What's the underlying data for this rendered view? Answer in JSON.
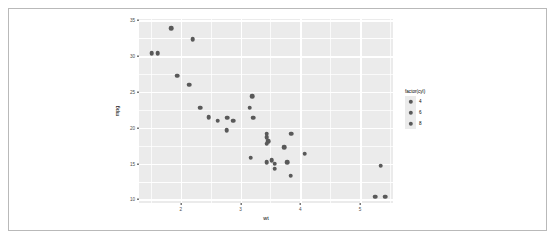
{
  "chart_data": {
    "type": "scatter",
    "title": "",
    "xlabel": "wt",
    "ylabel": "mpg",
    "xlim": [
      1.3,
      5.55
    ],
    "ylim": [
      9.5,
      35.2
    ],
    "xticks": [
      "2",
      "3",
      "4",
      "5"
    ],
    "xtick_values": [
      2,
      3,
      4,
      5
    ],
    "yticks": [
      "35",
      "30",
      "25",
      "20",
      "15",
      "10"
    ],
    "ytick_values": [
      35,
      30,
      25,
      20,
      15,
      10
    ],
    "grid": true,
    "legend": {
      "title": "factor(cyl)",
      "position": "right",
      "entries": [
        {
          "label": "4",
          "color": "#595959"
        },
        {
          "label": "6",
          "color": "#595959"
        },
        {
          "label": "8",
          "color": "#595959"
        }
      ]
    },
    "point_color": "#595959",
    "panel_color": "#ebebeb",
    "gridline_color": "#ffffff",
    "series": [
      {
        "name": "mtcars",
        "x": [
          2.62,
          2.875,
          2.32,
          3.215,
          3.44,
          3.46,
          3.57,
          3.19,
          3.15,
          3.44,
          3.44,
          4.07,
          3.73,
          3.78,
          5.25,
          5.424,
          5.345,
          2.2,
          1.615,
          1.835,
          2.465,
          3.52,
          3.435,
          3.84,
          3.845,
          1.935,
          2.14,
          1.513,
          3.17,
          2.77,
          3.57,
          2.78
        ],
        "y": [
          21.0,
          21.0,
          22.8,
          21.4,
          18.7,
          18.1,
          14.3,
          24.4,
          22.8,
          19.2,
          17.8,
          16.4,
          17.3,
          15.2,
          10.4,
          10.4,
          14.7,
          32.4,
          30.4,
          33.9,
          21.5,
          15.5,
          15.2,
          13.3,
          19.2,
          27.3,
          26.0,
          30.4,
          15.8,
          19.7,
          15.0,
          21.4
        ],
        "cyl": [
          6,
          6,
          4,
          6,
          8,
          6,
          8,
          4,
          4,
          6,
          6,
          8,
          8,
          8,
          8,
          8,
          8,
          4,
          4,
          4,
          4,
          8,
          8,
          8,
          8,
          4,
          4,
          4,
          8,
          6,
          8,
          4
        ]
      }
    ]
  }
}
